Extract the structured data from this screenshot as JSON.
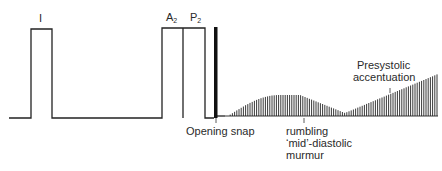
{
  "diagram": {
    "labels": {
      "s1": "I",
      "a2": "A",
      "a2_sub": "2",
      "p2": "P",
      "p2_sub": "2",
      "opening_snap": "Opening snap",
      "murmur_line1": "rumbling",
      "murmur_line2": "‘mid’-diastolic",
      "murmur_line3": "murmur",
      "presystolic_line1": "Presystolic",
      "presystolic_line2": "accentuation"
    },
    "colors": {
      "line": "#222222",
      "background": "#ffffff"
    }
  }
}
